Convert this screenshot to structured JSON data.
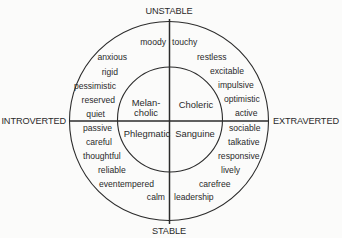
{
  "diagram": {
    "type": "personality-temperament-circle",
    "axes": {
      "top": "UNSTABLE",
      "bottom": "STABLE",
      "left": "INTROVERTED",
      "right": "EXTRAVERTED"
    },
    "temperaments": {
      "top_left": [
        "Melan-",
        "cholic"
      ],
      "top_right": "Choleric",
      "bottom_left": "Phlegmatic",
      "bottom_right": "Sanguine"
    },
    "traits": {
      "top_left": [
        "moody",
        "anxious",
        "rigid",
        "pessimistic",
        "reserved",
        "quiet"
      ],
      "top_right": [
        "touchy",
        "restless",
        "excitable",
        "impulsive",
        "optimistic",
        "active"
      ],
      "bottom_left": [
        "passive",
        "careful",
        "thoughtful",
        "reliable",
        "eventempered",
        "calm"
      ],
      "bottom_right": [
        "sociable",
        "talkative",
        "responsive",
        "lively",
        "carefree",
        "leadership"
      ]
    }
  },
  "colors": {
    "background": "#fbfbfa",
    "ink": "#2b2b2b"
  }
}
